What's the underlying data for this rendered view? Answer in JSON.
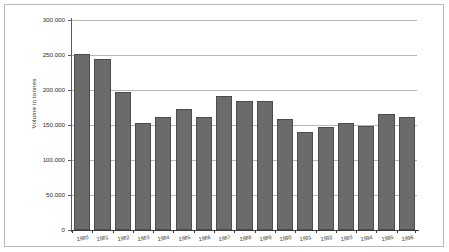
{
  "chart_data": {
    "type": "bar",
    "title": "",
    "subtitle": "",
    "xlabel": "",
    "ylabel": "Volume in tonnes",
    "categories": [
      "1980",
      "1981",
      "1982",
      "1983",
      "1984",
      "1985",
      "1986",
      "1987",
      "1988",
      "1989",
      "1990",
      "1991",
      "1992",
      "1993",
      "1994",
      "1995",
      "1996"
    ],
    "values": [
      251000,
      245000,
      197000,
      153000,
      161000,
      173000,
      161000,
      192000,
      184000,
      184000,
      159000,
      140000,
      147000,
      153000,
      149000,
      166000,
      162000
    ],
    "series": [
      {
        "name": "Volume in tonnes",
        "values": [
          251000,
          245000,
          197000,
          153000,
          161000,
          173000,
          161000,
          192000,
          184000,
          184000,
          159000,
          140000,
          147000,
          153000,
          149000,
          166000,
          162000
        ]
      }
    ],
    "ylim": [
      0,
      300000
    ],
    "ytick_values": [
      0,
      50000,
      100000,
      150000,
      200000,
      250000,
      300000
    ],
    "ytick_labels": [
      "0",
      "50.000",
      "100.000",
      "150.000",
      "200.000",
      "250.000",
      "300.000"
    ],
    "grid": true,
    "grid_axis": "y",
    "legend": false,
    "legend_position": "none",
    "bar_color": "#6b6b6b",
    "bar_edge_color": "#4c4c4c",
    "grid_color": "#b7b7b7",
    "axis_color": "#3b3b3b",
    "background_color": "#ffffff",
    "frame_color": "#b9b9b9"
  }
}
